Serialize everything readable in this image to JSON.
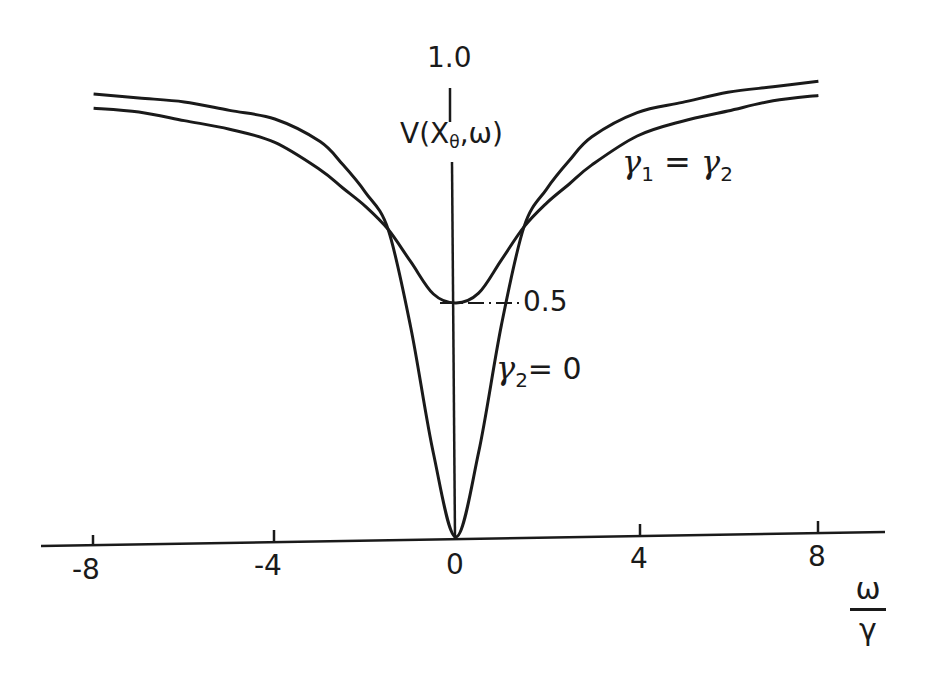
{
  "chart_data": {
    "type": "line",
    "title": "",
    "xlabel": "ω/γ",
    "ylabel": "V(X_θ, ω)",
    "xlim": [
      -9.0,
      9.6
    ],
    "ylim": [
      0,
      1.0
    ],
    "x_ticks": [
      -8,
      -4,
      0,
      4,
      8
    ],
    "x_tick_labels": [
      "-8",
      "-4",
      "0",
      "4",
      "8"
    ],
    "y_ticks": [
      0.5,
      1.0
    ],
    "y_tick_labels": [
      "0.5",
      "1.0"
    ],
    "grid": false,
    "legend": "inline annotations",
    "x": [
      -8,
      -7,
      -6,
      -5,
      -4,
      -3,
      -2.5,
      -2,
      -1.5,
      -1,
      -0.5,
      0,
      0.5,
      1,
      1.5,
      2,
      2.5,
      3,
      4,
      5,
      6,
      7,
      8
    ],
    "series": [
      {
        "name": "γ1 = γ2",
        "values": [
          0.93,
          0.92,
          0.9,
          0.88,
          0.85,
          0.79,
          0.75,
          0.71,
          0.66,
          0.59,
          0.52,
          0.5,
          0.52,
          0.59,
          0.66,
          0.71,
          0.75,
          0.79,
          0.85,
          0.88,
          0.9,
          0.92,
          0.93
        ]
      },
      {
        "name": "γ2 = 0",
        "values": [
          0.96,
          0.95,
          0.94,
          0.92,
          0.9,
          0.85,
          0.8,
          0.74,
          0.66,
          0.45,
          0.18,
          0.0,
          0.18,
          0.45,
          0.66,
          0.74,
          0.8,
          0.85,
          0.9,
          0.92,
          0.94,
          0.95,
          0.96
        ]
      }
    ],
    "annotations": [
      {
        "text": "γ1 = γ2",
        "near": "right outer curve"
      },
      {
        "text": "γ2 = 0",
        "near": "right branch of dip"
      },
      {
        "text": "0.5",
        "near": "dash-dot marker at minimum of γ1=γ2 curve"
      }
    ]
  },
  "labels": {
    "y_top": "1.0",
    "y_axis_name": "V",
    "y_axis_arg_open": "(X",
    "y_axis_arg_sub": "θ",
    "y_axis_arg_close": ",ω)",
    "half": "0.5",
    "x_num": "ω",
    "x_den": "γ",
    "curve_a_gamma": "γ",
    "curve_a_sub1": "1",
    "curve_a_eq": "=",
    "curve_a_sub2": "2",
    "curve_b_gamma": "γ",
    "curve_b_sub": "2",
    "curve_b_eq": "= 0",
    "tick_m8": "-8",
    "tick_m4": "-4",
    "tick_0": "0",
    "tick_4": "4",
    "tick_8": "8"
  }
}
